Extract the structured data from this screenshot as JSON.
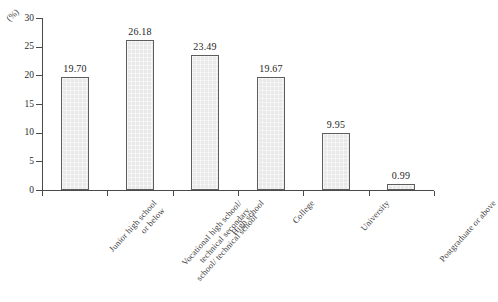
{
  "chart_data": {
    "type": "bar",
    "title": "",
    "xlabel": "",
    "ylabel": "(%)",
    "ylim": [
      0,
      30
    ],
    "ytick_values": [
      0,
      5,
      10,
      15,
      20,
      25,
      30
    ],
    "ytick_labels": [
      "0",
      "5",
      "10",
      "15",
      "20",
      "25",
      "30"
    ],
    "grid": false,
    "legend": false,
    "categories": [
      "Junior high school or below",
      "Vocational high school/ technical secondary school/ technical school",
      "High school",
      "College",
      "University",
      "Postgraduate or above"
    ],
    "category_lines": [
      [
        "Junior high school",
        "or below"
      ],
      [
        "Vocational high school/",
        "technical secondary",
        "school/ technical school"
      ],
      [
        "High school"
      ],
      [
        "College"
      ],
      [
        "University"
      ],
      [
        "Postgraduate or above"
      ]
    ],
    "values": [
      19.7,
      26.18,
      23.49,
      19.67,
      9.95,
      0.99
    ],
    "value_labels": [
      "19.70",
      "26.18",
      "23.49",
      "19.67",
      "9.95",
      "0.99"
    ],
    "colors": {
      "bar_fill": "#e9e9e9",
      "bar_border": "#5d5d5d",
      "axis": "#4a4a4a",
      "text": "#2b2b2b",
      "background": "#ffffff"
    }
  }
}
